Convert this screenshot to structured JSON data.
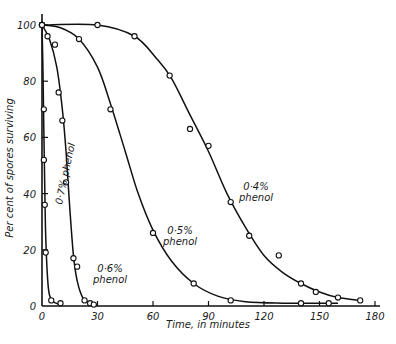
{
  "chart_data": {
    "type": "line",
    "title": "",
    "xlabel": "Time, in minutes",
    "ylabel": "Per cent of spores surviving",
    "xlim": [
      0,
      180
    ],
    "ylim": [
      0,
      100
    ],
    "xticks": [
      0,
      30,
      60,
      90,
      120,
      150,
      180
    ],
    "yticks": [
      0,
      20,
      40,
      60,
      80,
      100
    ],
    "grid": false,
    "legend": "inline curve labels",
    "series": [
      {
        "name": "0·7% phenol",
        "label_line1": "0·7% phenol",
        "points": [
          [
            0,
            100
          ],
          [
            1,
            70
          ],
          [
            1,
            52
          ],
          [
            1.5,
            36
          ],
          [
            2,
            19
          ],
          [
            5,
            2
          ],
          [
            10,
            1
          ]
        ],
        "curve": [
          [
            0,
            100
          ],
          [
            0.5,
            85
          ],
          [
            1,
            62
          ],
          [
            1.5,
            42
          ],
          [
            2,
            25
          ],
          [
            3,
            10
          ],
          [
            4,
            4
          ],
          [
            6,
            1.5
          ],
          [
            10,
            0.5
          ]
        ]
      },
      {
        "name": "0·6% phenol",
        "label_line1": "0·6%",
        "label_line2": "phenol",
        "points": [
          [
            0,
            100
          ],
          [
            3,
            96
          ],
          [
            7,
            93
          ],
          [
            9,
            76
          ],
          [
            11,
            66
          ],
          [
            13,
            44
          ],
          [
            17,
            17
          ],
          [
            19,
            14
          ],
          [
            23,
            2
          ],
          [
            26,
            1
          ],
          [
            28,
            0.5
          ]
        ],
        "curve": [
          [
            0,
            100
          ],
          [
            4,
            95
          ],
          [
            8,
            85
          ],
          [
            11,
            70
          ],
          [
            13,
            55
          ],
          [
            15,
            35
          ],
          [
            17,
            18
          ],
          [
            19,
            9
          ],
          [
            22,
            3
          ],
          [
            26,
            1
          ],
          [
            30,
            0.3
          ]
        ]
      },
      {
        "name": "0·5% phenol",
        "label_line1": "0·5%",
        "label_line2": "phenol",
        "points": [
          [
            0,
            100
          ],
          [
            20,
            95
          ],
          [
            37,
            70
          ],
          [
            60,
            26
          ],
          [
            82,
            8
          ],
          [
            102,
            2
          ],
          [
            140,
            1
          ],
          [
            155,
            1
          ]
        ],
        "curve": [
          [
            0,
            100
          ],
          [
            10,
            99
          ],
          [
            20,
            95
          ],
          [
            30,
            85
          ],
          [
            37,
            72
          ],
          [
            45,
            55
          ],
          [
            52,
            40
          ],
          [
            60,
            27
          ],
          [
            70,
            16
          ],
          [
            82,
            8
          ],
          [
            95,
            3.5
          ],
          [
            110,
            1.5
          ],
          [
            130,
            1
          ],
          [
            160,
            1
          ]
        ]
      },
      {
        "name": "0·4% phenol",
        "label_line1": "0·4%",
        "label_line2": "phenol",
        "points": [
          [
            0,
            100
          ],
          [
            30,
            100
          ],
          [
            50,
            96
          ],
          [
            69,
            82
          ],
          [
            80,
            63
          ],
          [
            90,
            57
          ],
          [
            102,
            37
          ],
          [
            112,
            25
          ],
          [
            128,
            18
          ],
          [
            140,
            8
          ],
          [
            148,
            5
          ],
          [
            160,
            3
          ],
          [
            172,
            2
          ]
        ],
        "curve": [
          [
            0,
            100
          ],
          [
            30,
            100
          ],
          [
            50,
            96
          ],
          [
            62,
            88
          ],
          [
            70,
            81
          ],
          [
            80,
            68
          ],
          [
            90,
            55
          ],
          [
            100,
            40
          ],
          [
            110,
            28
          ],
          [
            120,
            18
          ],
          [
            130,
            12
          ],
          [
            140,
            8
          ],
          [
            150,
            5
          ],
          [
            160,
            3
          ],
          [
            172,
            2
          ]
        ]
      }
    ]
  }
}
